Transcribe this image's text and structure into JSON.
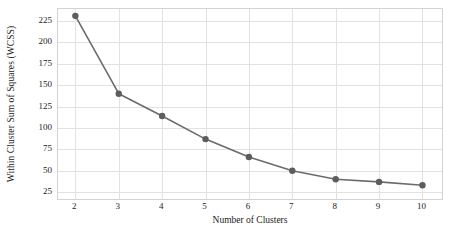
{
  "chart_data": {
    "type": "line",
    "title": "",
    "xlabel": "Number of Clusters",
    "ylabel": "Within Cluster Sum of Squares (WCSS)",
    "x": [
      2,
      3,
      4,
      5,
      6,
      7,
      8,
      9,
      10
    ],
    "values": [
      231,
      140,
      114,
      87,
      66,
      50,
      40,
      37,
      33
    ],
    "series": [
      {
        "name": "WCSS",
        "values": [
          231,
          140,
          114,
          87,
          66,
          50,
          40,
          37,
          33
        ]
      }
    ],
    "xtick_labels": [
      "2",
      "3",
      "4",
      "5",
      "6",
      "7",
      "8",
      "9",
      "10"
    ],
    "ytick_labels": [
      "25",
      "50",
      "75",
      "100",
      "125",
      "150",
      "175",
      "200",
      "225"
    ],
    "ytick_values": [
      25,
      50,
      75,
      100,
      125,
      150,
      175,
      200,
      225
    ],
    "xlim": [
      1.6,
      10.45
    ],
    "ylim": [
      17,
      239
    ],
    "grid": true,
    "legend": "none",
    "line_color": "#6b6b6b",
    "marker_color": "#5d5d5d",
    "grid_color": "#e2e2e2",
    "axis_color": "#d2d2d2",
    "text_color": "#1a1a1a",
    "marker": "circle",
    "marker_size": 3.2,
    "line_width": 1.6
  }
}
